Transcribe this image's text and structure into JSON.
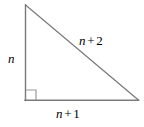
{
  "figure": {
    "kind": "right-triangle-diagram",
    "background_color": "#ffffff",
    "stroke_color": "#7a7a7a",
    "text_color": "#000000",
    "width": 144,
    "height": 127
  },
  "triangle": {
    "vertices": {
      "top": {
        "x": 25,
        "y": 5
      },
      "bottom_left": {
        "x": 25,
        "y": 100
      },
      "bottom_right": {
        "x": 138,
        "y": 100
      }
    },
    "right_angle_marker": {
      "corner": "bottom-left",
      "size": 10
    }
  },
  "labels": {
    "vertical_leg": {
      "variable": "n",
      "operator": "",
      "number": ""
    },
    "hypotenuse": {
      "variable": "n",
      "operator": "+",
      "number": "2"
    },
    "horizontal_leg": {
      "variable": "n",
      "operator": "+",
      "number": "1"
    }
  }
}
